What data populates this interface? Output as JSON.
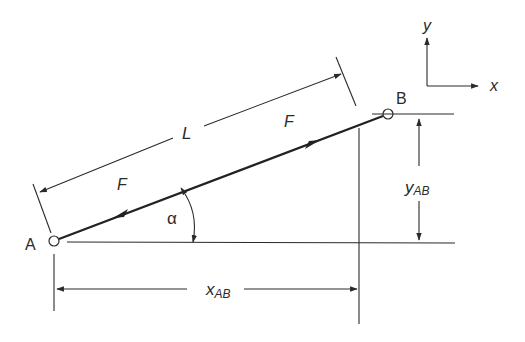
{
  "diagram": {
    "type": "truss member force components",
    "points": {
      "A": {
        "label": "A",
        "x": 54,
        "y": 241
      },
      "B": {
        "label": "B",
        "x": 388,
        "y": 114
      }
    },
    "labels": {
      "length": "L",
      "force_upper": "F",
      "force_lower": "F",
      "angle": "α",
      "x_dim_main": "x",
      "x_dim_sub": "AB",
      "y_dim_main": "y",
      "y_dim_sub": "AB",
      "axis_x": "x",
      "axis_y": "y"
    },
    "colors": {
      "stroke": "#2a2a2a",
      "background": "#ffffff"
    }
  }
}
